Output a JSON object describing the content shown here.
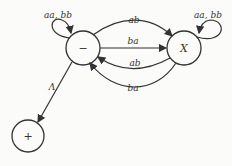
{
  "diagram": {
    "type": "finite-automaton",
    "states": [
      {
        "id": "start",
        "label": "−",
        "x": 83,
        "y": 48
      },
      {
        "id": "x",
        "label": "X",
        "x": 184,
        "y": 48
      },
      {
        "id": "final",
        "label": "+",
        "x": 28,
        "y": 136
      }
    ],
    "edges": [
      {
        "from": "start",
        "to": "start",
        "label": "aa, bb"
      },
      {
        "from": "x",
        "to": "x",
        "label": "aa, bb"
      },
      {
        "from": "start",
        "to": "x",
        "label": "ab"
      },
      {
        "from": "start",
        "to": "x",
        "label": "ba"
      },
      {
        "from": "x",
        "to": "start",
        "label": "ab"
      },
      {
        "from": "x",
        "to": "start",
        "label": "ba"
      },
      {
        "from": "start",
        "to": "final",
        "label": "Λ"
      }
    ]
  }
}
